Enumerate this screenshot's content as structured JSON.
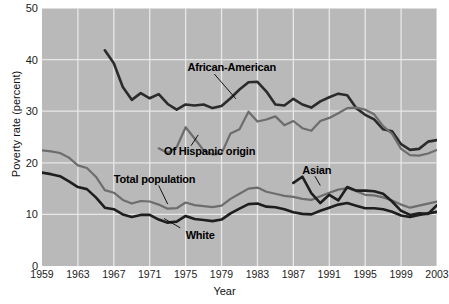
{
  "chart_data": {
    "type": "line",
    "title": "",
    "xlabel": "Year",
    "ylabel": "Poverty rate (percent)",
    "xlim": [
      1959,
      2003
    ],
    "ylim": [
      0,
      50
    ],
    "yticks": [
      0,
      10,
      20,
      30,
      40,
      50
    ],
    "xticks": [
      1959,
      1963,
      1967,
      1971,
      1975,
      1979,
      1983,
      1987,
      1991,
      1995,
      1999,
      2003
    ],
    "grid": true,
    "legend_position": "inline-annotations",
    "plot_background": "#b9b9b9",
    "series": [
      {
        "name": "African-American",
        "color": "#2b2b2b",
        "width": 2.6,
        "label_x": 1975.2,
        "label_y": 38.6,
        "leader": [
          [
            1978.2,
            37.2
          ],
          [
            1980.6,
            32.4
          ]
        ],
        "x": [
          1966,
          1967,
          1968,
          1969,
          1970,
          1971,
          1972,
          1973,
          1974,
          1975,
          1976,
          1977,
          1978,
          1979,
          1980,
          1981,
          1982,
          1983,
          1984,
          1985,
          1986,
          1987,
          1988,
          1989,
          1990,
          1991,
          1992,
          1993,
          1994,
          1995,
          1996,
          1997,
          1998,
          1999,
          2000,
          2001,
          2002,
          2003
        ],
        "y": [
          41.8,
          39.3,
          34.7,
          32.2,
          33.5,
          32.5,
          33.3,
          31.4,
          30.3,
          31.3,
          31.1,
          31.3,
          30.6,
          31.0,
          32.5,
          34.2,
          35.6,
          35.7,
          33.8,
          31.3,
          31.1,
          32.4,
          31.3,
          30.7,
          31.9,
          32.7,
          33.4,
          33.1,
          30.6,
          29.3,
          28.4,
          26.5,
          26.1,
          23.6,
          22.5,
          22.7,
          24.1,
          24.4
        ]
      },
      {
        "name": "Of Hispanic origin",
        "color": "#6d6d6d",
        "width": 2.2,
        "label_x": 1972.6,
        "label_y": 22.3,
        "leader": [
          [
            1975.6,
            23.3
          ],
          [
            1976.4,
            25.4
          ]
        ],
        "x": [
          1972,
          1973,
          1974,
          1975,
          1976,
          1977,
          1978,
          1979,
          1980,
          1981,
          1982,
          1983,
          1984,
          1985,
          1986,
          1987,
          1988,
          1989,
          1990,
          1991,
          1992,
          1993,
          1994,
          1995,
          1996,
          1997,
          1998,
          1999,
          2000,
          2001,
          2002,
          2003
        ],
        "y": [
          22.8,
          21.9,
          23.0,
          26.9,
          24.7,
          22.4,
          21.6,
          21.8,
          25.7,
          26.5,
          29.9,
          28.0,
          28.4,
          29.0,
          27.3,
          28.1,
          26.7,
          26.2,
          28.1,
          28.7,
          29.6,
          30.6,
          30.7,
          30.3,
          29.4,
          27.1,
          25.6,
          22.7,
          21.5,
          21.4,
          21.8,
          22.5
        ]
      },
      {
        "name": "Total population",
        "color": "#6d6d6d",
        "width": 2.2,
        "label_x": 1967.0,
        "label_y": 16.8,
        "leader": [
          [
            1972.0,
            15.6
          ],
          [
            1973.0,
            12.0
          ]
        ],
        "x": [
          1959,
          1960,
          1961,
          1962,
          1963,
          1964,
          1965,
          1966,
          1967,
          1968,
          1969,
          1970,
          1971,
          1972,
          1973,
          1974,
          1975,
          1976,
          1977,
          1978,
          1979,
          1980,
          1981,
          1982,
          1983,
          1984,
          1985,
          1986,
          1987,
          1988,
          1989,
          1990,
          1991,
          1992,
          1993,
          1994,
          1995,
          1996,
          1997,
          1998,
          1999,
          2000,
          2001,
          2002,
          2003
        ],
        "y": [
          22.4,
          22.2,
          21.9,
          21.0,
          19.5,
          19.0,
          17.3,
          14.7,
          14.2,
          12.8,
          12.1,
          12.6,
          12.5,
          11.9,
          11.1,
          11.2,
          12.3,
          11.8,
          11.6,
          11.4,
          11.7,
          13.0,
          14.0,
          15.0,
          15.2,
          14.4,
          14.0,
          13.6,
          13.4,
          13.0,
          12.8,
          13.5,
          14.2,
          14.8,
          15.1,
          14.5,
          13.8,
          13.7,
          13.3,
          12.7,
          11.9,
          11.3,
          11.7,
          12.1,
          12.5
        ]
      },
      {
        "name": "White",
        "color": "#1e1e1e",
        "width": 2.6,
        "label_x": 1975.0,
        "label_y": 6.0,
        "leader": [
          [
            1974.4,
            7.4
          ],
          [
            1972.6,
            9.2
          ]
        ],
        "x": [
          1959,
          1960,
          1961,
          1962,
          1963,
          1964,
          1965,
          1966,
          1967,
          1968,
          1969,
          1970,
          1971,
          1972,
          1973,
          1974,
          1975,
          1976,
          1977,
          1978,
          1979,
          1980,
          1981,
          1982,
          1983,
          1984,
          1985,
          1986,
          1987,
          1988,
          1989,
          1990,
          1991,
          1992,
          1993,
          1994,
          1995,
          1996,
          1997,
          1998,
          1999,
          2000,
          2001,
          2002,
          2003
        ],
        "y": [
          18.1,
          17.8,
          17.4,
          16.4,
          15.3,
          14.9,
          13.3,
          11.3,
          11.0,
          10.0,
          9.5,
          9.9,
          9.9,
          9.0,
          8.4,
          8.6,
          9.7,
          9.1,
          8.9,
          8.7,
          9.0,
          10.2,
          11.1,
          12.0,
          12.1,
          11.5,
          11.4,
          11.0,
          10.4,
          10.1,
          10.0,
          10.7,
          11.3,
          11.9,
          12.2,
          11.7,
          11.2,
          11.2,
          11.0,
          10.5,
          9.8,
          9.5,
          9.9,
          10.2,
          10.5
        ]
      },
      {
        "name": "Asian",
        "color": "#1e1e1e",
        "width": 2.6,
        "label_x": 1988.0,
        "label_y": 18.6,
        "leader": [
          [
            1989.4,
            17.4
          ],
          [
            1990.0,
            15.6
          ]
        ],
        "x": [
          1987,
          1988,
          1989,
          1990,
          1991,
          1992,
          1993,
          1994,
          1995,
          1996,
          1997,
          1998,
          1999,
          2000,
          2001,
          2002,
          2003
        ],
        "y": [
          16.1,
          17.3,
          14.1,
          12.2,
          13.8,
          12.7,
          15.3,
          14.6,
          14.6,
          14.5,
          14.0,
          12.5,
          10.7,
          9.9,
          10.2,
          10.1,
          11.8
        ]
      }
    ]
  },
  "axes": {
    "ylabel": "Poverty rate (percent)",
    "xlabel": "Year",
    "yticks": [
      "0",
      "10",
      "20",
      "30",
      "40",
      "50"
    ],
    "xticks": [
      "1959",
      "1963",
      "1967",
      "1971",
      "1975",
      "1979",
      "1983",
      "1987",
      "1991",
      "1995",
      "1999",
      "2003"
    ]
  }
}
